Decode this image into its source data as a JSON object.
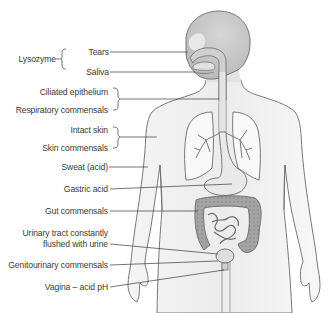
{
  "diagram": {
    "type": "anatomical-illustration",
    "colors": {
      "outline": "#6a6a6a",
      "skin_fill": "#f1f1f1",
      "head_fill": "#c8c8c8",
      "organ_fill": "#d9d9d9",
      "gut_fill": "#a9a9a9",
      "leader_line": "#3a3a3a",
      "text": "#3a3a3a"
    },
    "labels": {
      "lysozyme": "Lysozyme",
      "tears": "Tears",
      "saliva": "Saliva",
      "ciliated_epithelium": "Ciliated epithelium",
      "respiratory_commensals": "Respiratory commensals",
      "intact_skin": "Intact skin",
      "skin_commensals": "Skin commensals",
      "sweat": "Sweat (acid)",
      "gastric_acid": "Gastric acid",
      "gut_commensals": "Gut commensals",
      "urinary_line1": "Urinary tract constantly",
      "urinary_line2": "flushed with urine",
      "genitourinary_commensals": "Genitourinary commensals",
      "vagina": "Vagina – acid pH"
    }
  }
}
